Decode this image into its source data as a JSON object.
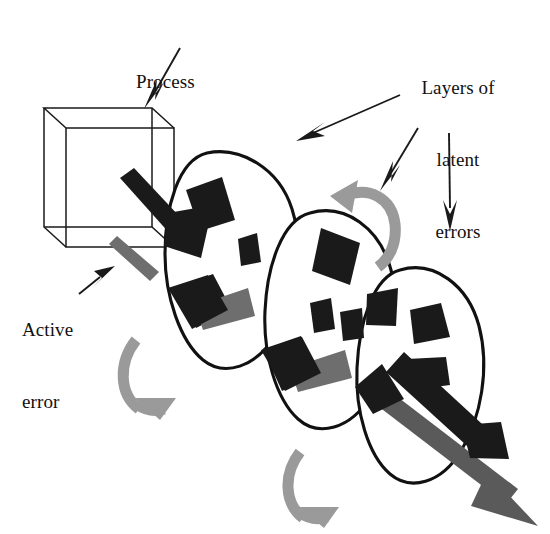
{
  "figure": {
    "title_alt": "Swiss cheese model of accident causation",
    "background_color": "#ffffff",
    "width": 550,
    "height": 534
  },
  "labels": {
    "process": {
      "text": "Process",
      "lines": [
        "Process"
      ],
      "color": "#111111",
      "align": "left"
    },
    "layers_of_latent_errors": {
      "text": "Layers of latent errors",
      "lines": [
        "Layers of",
        "latent",
        "errors"
      ],
      "color": "#111111",
      "align": "center"
    },
    "active_error": {
      "text": "Active error",
      "lines": [
        "Active",
        "error"
      ],
      "color": "#111111",
      "align": "left"
    }
  },
  "colors": {
    "outline": "#111111",
    "hole_fill": "#1a1a1a",
    "grey_arrow": "#6e6e6e",
    "light_grey_arrow": "#9a9a9a",
    "cube_line": "#1a1a1a",
    "paper": "#ffffff"
  },
  "elements": {
    "cube": {
      "name": "process-cube",
      "style": "wireframe",
      "stroke_width": 1.4
    },
    "layers": [
      {
        "name": "latent-error-layer-1",
        "holes": 3
      },
      {
        "name": "latent-error-layer-2",
        "holes": 3
      },
      {
        "name": "latent-error-layer-3",
        "holes": 3
      }
    ],
    "rotation_arrows": [
      {
        "name": "rotation-arrow-layer-1",
        "color": "#9a9a9a"
      },
      {
        "name": "rotation-arrow-layer-2",
        "color": "#9a9a9a"
      },
      {
        "name": "rotation-arrow-layer-3",
        "color": "#9a9a9a"
      }
    ],
    "trajectory_arrows": [
      {
        "name": "active-error-arrow-dark-1",
        "color": "#1a1a1a"
      },
      {
        "name": "active-error-arrow-grey-1",
        "color": "#6e6e6e"
      },
      {
        "name": "accident-trajectory-arrow",
        "color": "#5a5a5a"
      },
      {
        "name": "accident-trajectory-arrow-dark",
        "color": "#1a1a1a"
      }
    ],
    "pointer_arrows": [
      {
        "name": "pointer-arrow-process",
        "target": "cube"
      },
      {
        "name": "pointer-arrow-layers-1",
        "target": "layer-1"
      },
      {
        "name": "pointer-arrow-layers-2",
        "target": "layer-2"
      },
      {
        "name": "pointer-arrow-layers-3",
        "target": "layer-3"
      },
      {
        "name": "pointer-arrow-active-error",
        "target": "active-error-arrow"
      }
    ]
  }
}
